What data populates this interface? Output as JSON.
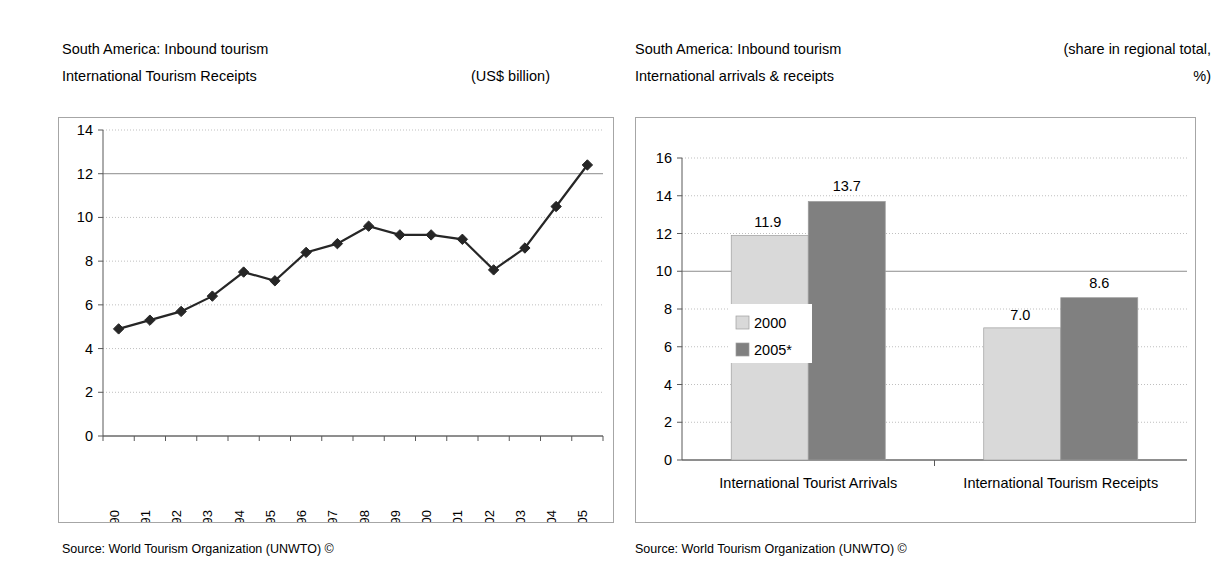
{
  "left_panel": {
    "title_line1": "South America: Inbound tourism",
    "title_line2": "International Tourism Receipts",
    "units": "(US$ billion)",
    "source": "Source: World Tourism Organization (UNWTO) ©"
  },
  "right_panel": {
    "title_line1": "South America: Inbound tourism",
    "title_line2": "International arrivals & receipts",
    "units_line1": "(share in regional total,",
    "units_line2": "%)",
    "source": "Source: World Tourism Organization (UNWTO) ©"
  },
  "colors": {
    "series_2000": "#d9d9d9",
    "series_2005": "#808080",
    "line": "#262626",
    "marker": "#262626",
    "frame": "#a6a6a6",
    "gridline": "#bfbfbf",
    "axis": "#808080"
  },
  "chart_data": [
    {
      "type": "line",
      "id": "receipts-timeseries",
      "title": "South America: Inbound tourism — International Tourism Receipts",
      "xlabel": "",
      "ylabel": "US$ billion",
      "ylim": [
        0,
        14
      ],
      "ytick_step": 2,
      "yticks": [
        "0",
        "2",
        "4",
        "6",
        "8",
        "10",
        "12",
        "14"
      ],
      "grid": true,
      "legend": "none",
      "marker": "diamond",
      "categories": [
        "1990",
        "1991",
        "1992",
        "1993",
        "1994",
        "1995",
        "1996",
        "1997",
        "1998",
        "1999",
        "2000",
        "2001",
        "2002",
        "2003",
        "2004",
        "2005"
      ],
      "values": [
        4.9,
        5.3,
        5.7,
        6.4,
        7.5,
        7.1,
        8.4,
        8.8,
        9.6,
        9.2,
        9.2,
        9.0,
        7.6,
        8.6,
        10.5,
        12.4
      ]
    },
    {
      "type": "bar",
      "id": "share-in-regional-total",
      "title": "South America: Inbound tourism — International arrivals & receipts",
      "xlabel": "",
      "ylabel": "share in regional total, %",
      "ylim": [
        0,
        16
      ],
      "ytick_step": 2,
      "yticks": [
        "0",
        "2",
        "4",
        "6",
        "8",
        "10",
        "12",
        "14",
        "16"
      ],
      "grid": true,
      "legend": "inside-left",
      "categories": [
        "International Tourist Arrivals",
        "International Tourism Receipts"
      ],
      "series": [
        {
          "name": "2000",
          "values": [
            11.9,
            7.0
          ],
          "labels": [
            "11.9",
            "7.0"
          ]
        },
        {
          "name": "2005*",
          "values": [
            13.7,
            8.6
          ],
          "labels": [
            "13.7",
            "8.6"
          ]
        }
      ]
    }
  ]
}
